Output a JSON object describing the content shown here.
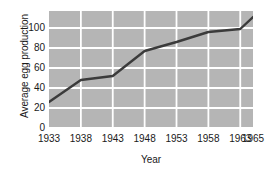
{
  "chart_data": {
    "type": "line",
    "title": "",
    "xlabel": "Year",
    "ylabel": "Average egg production",
    "x": [
      1933,
      1938,
      1943,
      1948,
      1953,
      1958,
      1963,
      1965
    ],
    "values": [
      26,
      48,
      52,
      77,
      86,
      96,
      99,
      111
    ],
    "series": [
      {
        "name": "Average egg production",
        "values": [
          26,
          48,
          52,
          77,
          86,
          96,
          99,
          111
        ]
      }
    ],
    "xlim": [
      1933,
      1965
    ],
    "ylim": [
      0,
      117
    ],
    "xticks": [
      1933,
      1938,
      1943,
      1948,
      1953,
      1958,
      1963,
      1965
    ],
    "xtick_labels": [
      "1933",
      "1938",
      "1943",
      "1948",
      "1953",
      "1958",
      "1963",
      "1965"
    ],
    "yticks": [
      0,
      20,
      40,
      60,
      80,
      100
    ],
    "ytick_labels": [
      "0",
      "20",
      "40",
      "60",
      "80",
      "100"
    ],
    "grid": true,
    "grid_color": "#ffffff",
    "plot_background": "#b5b5b5",
    "line_color": "#3b3b3b",
    "legend": false,
    "markers": false,
    "annotations": []
  },
  "axes": {
    "y_title": "Average egg production",
    "x_title": "Year"
  }
}
